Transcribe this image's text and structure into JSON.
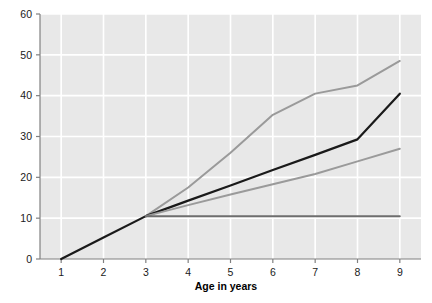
{
  "figure": {
    "clipped_header_text": "",
    "background_color": "#ffffff",
    "plot_background_color": "#e8e8e8",
    "gridline_color": "#ffffff",
    "axis_color": "#808080"
  },
  "chart_data": {
    "type": "line",
    "title": "",
    "xlabel": "Age in years",
    "ylabel": "",
    "xlim": [
      0.5,
      9.5
    ],
    "ylim": [
      0,
      60
    ],
    "xticks": [
      1,
      2,
      3,
      4,
      5,
      6,
      7,
      8,
      9
    ],
    "xtick_labels": [
      "1",
      "2",
      "3",
      "4",
      "5",
      "6",
      "7",
      "8",
      "9"
    ],
    "yticks": [
      0,
      10,
      20,
      30,
      40,
      50,
      60
    ],
    "ytick_labels": [
      "0",
      "10",
      "20",
      "30",
      "40",
      "50",
      "60"
    ],
    "grid": true,
    "grid_axes": "both",
    "legend": false,
    "legend_position": "none",
    "series": [
      {
        "name": "steepest-growth-curve",
        "color": "#9a9a9a",
        "line_width": 2.0,
        "x": [
          3,
          4,
          5,
          6,
          7,
          8,
          9
        ],
        "values": [
          10.5,
          17.5,
          26.0,
          35.3,
          40.5,
          42.5,
          48.5
        ]
      },
      {
        "name": "linear-reference-line",
        "color": "#1a1a1a",
        "line_width": 2.2,
        "x": [
          1,
          2,
          3,
          4,
          5,
          6,
          7,
          8,
          9
        ],
        "values": [
          0.0,
          5.25,
          10.5,
          14.3,
          18.0,
          21.8,
          25.5,
          29.3,
          40.5
        ]
      },
      {
        "name": "moderate-growth-curve",
        "color": "#9a9a9a",
        "line_width": 2.0,
        "x": [
          3,
          4,
          5,
          6,
          7,
          8,
          9
        ],
        "values": [
          10.5,
          13.2,
          15.8,
          18.3,
          20.8,
          23.9,
          27.0
        ]
      },
      {
        "name": "flat-no-growth-line",
        "color": "#6e6e6e",
        "line_width": 2.0,
        "x": [
          3,
          4,
          5,
          6,
          7,
          8,
          9
        ],
        "values": [
          10.5,
          10.5,
          10.5,
          10.5,
          10.5,
          10.5,
          10.5
        ]
      }
    ]
  }
}
